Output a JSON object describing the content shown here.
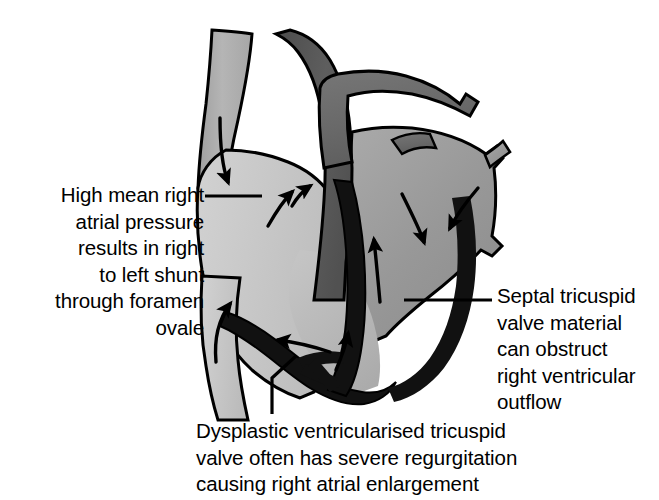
{
  "figure": {
    "type": "anatomical-diagram",
    "background_color": "#ffffff",
    "palette": {
      "right_atrium_gray": "#c9c9c9",
      "svc_gray": "#adadad",
      "aorta_dark_gray": "#555555",
      "pulmonary_artery_gray": "#6e6e6e",
      "left_heart_mid_gray": "#9a9a9a",
      "ventricle_light_gray": "#bdbdbd",
      "outline_black": "#000000",
      "valve_tissue_black": "#111111",
      "text_black": "#000000"
    },
    "structures": [
      {
        "name": "superior-vena-cava",
        "shade": "svc_gray"
      },
      {
        "name": "right-atrium",
        "shade": "right_atrium_gray"
      },
      {
        "name": "inferior-vena-cava",
        "shade": "right_atrium_gray"
      },
      {
        "name": "aortic-arch",
        "shade": "aorta_dark_gray"
      },
      {
        "name": "pulmonary-artery",
        "shade": "pulmonary_artery_gray"
      },
      {
        "name": "left-atrium",
        "shade": "left_heart_mid_gray"
      },
      {
        "name": "left-ventricle",
        "shade": "left_heart_mid_gray"
      },
      {
        "name": "right-ventricle",
        "shade": "ventricle_light_gray"
      },
      {
        "name": "interventricular-septum",
        "shade": "ventricle_light_gray"
      },
      {
        "name": "dysplastic-tricuspid-valve",
        "shade": "valve_tissue_black"
      },
      {
        "name": "septal-tricuspid-leaflet",
        "shade": "valve_tissue_black"
      }
    ],
    "flow_arrows": [
      {
        "name": "svc-inflow-arrow",
        "direction": "down-into-right-atrium"
      },
      {
        "name": "foramen-ovale-shunt-arrow",
        "direction": "right-to-left-across-septum"
      },
      {
        "name": "ivc-inflow-arrow",
        "direction": "up-into-right-atrium"
      },
      {
        "name": "regurgitation-arrow-left",
        "direction": "up-left-into-atrium"
      },
      {
        "name": "regurgitation-arrow-right",
        "direction": "up-into-atrium"
      },
      {
        "name": "left-atrium-inflow-arrow",
        "direction": "down-into-left-ventricle"
      },
      {
        "name": "pulmonary-vein-inflow-arrow",
        "direction": "down-left-into-left-atrium"
      },
      {
        "name": "rv-outflow-arrow",
        "direction": "up-through-outflow-tract"
      },
      {
        "name": "tricuspid-inflow-arrow",
        "direction": "up-right-at-valve"
      }
    ]
  },
  "annotations": {
    "left": {
      "id": "high-mean-right-atrial-pressure",
      "text": "High mean right\natrial pressure\nresults in right\nto left shunt\nthrough foramen\novale",
      "leader": "horizontal line from text to right atrium"
    },
    "right": {
      "id": "septal-tricuspid-valve-material",
      "text": "Septal tricuspid\nvalve material\ncan obstruct\nright ventricular\noutflow",
      "leader": "horizontal line from text to septal valve tissue"
    },
    "bottom": {
      "id": "dysplastic-ventricularised-tricuspid-valve",
      "text": "Dysplastic ventricularised tricuspid\nvalve often has severe regurgitation\ncausing right atrial enlargement",
      "leader": "angled line from text up to valve apparatus"
    }
  }
}
